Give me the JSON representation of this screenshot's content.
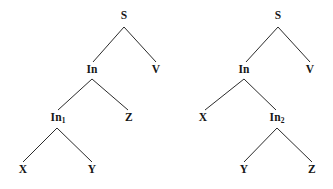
{
  "figure": {
    "background_color": "#ffffff",
    "edge_color": "#2b2b2b",
    "text_color": "#161616",
    "trees": [
      {
        "name": "left-tree",
        "root": "S",
        "nodes": [
          {
            "id": "l-s",
            "label": "S",
            "sub": "",
            "x": 124,
            "y": 16
          },
          {
            "id": "l-in",
            "label": "In",
            "sub": "",
            "x": 92,
            "y": 70
          },
          {
            "id": "l-v",
            "label": "V",
            "sub": "",
            "x": 156,
            "y": 70
          },
          {
            "id": "l-in1",
            "label": "In",
            "sub": "1",
            "x": 58,
            "y": 118
          },
          {
            "id": "l-z",
            "label": "Z",
            "sub": "",
            "x": 129,
            "y": 118
          },
          {
            "id": "l-x",
            "label": "X",
            "sub": "",
            "x": 23,
            "y": 170
          },
          {
            "id": "l-y",
            "label": "Y",
            "sub": "",
            "x": 92,
            "y": 170
          }
        ],
        "edges": [
          {
            "from": "l-s",
            "to": "l-in",
            "x1": 124,
            "y1": 27,
            "x2": 93,
            "y2": 62
          },
          {
            "from": "l-s",
            "to": "l-v",
            "x1": 124,
            "y1": 27,
            "x2": 156,
            "y2": 62
          },
          {
            "from": "l-in",
            "to": "l-in1",
            "x1": 92,
            "y1": 79,
            "x2": 58,
            "y2": 110
          },
          {
            "from": "l-in",
            "to": "l-z",
            "x1": 92,
            "y1": 79,
            "x2": 128,
            "y2": 110
          },
          {
            "from": "l-in1",
            "to": "l-x",
            "x1": 57,
            "y1": 128,
            "x2": 23,
            "y2": 162
          },
          {
            "from": "l-in1",
            "to": "l-y",
            "x1": 57,
            "y1": 128,
            "x2": 92,
            "y2": 162
          }
        ]
      },
      {
        "name": "right-tree",
        "root": "S",
        "nodes": [
          {
            "id": "r-s",
            "label": "S",
            "sub": "",
            "x": 278,
            "y": 16
          },
          {
            "id": "r-in",
            "label": "In",
            "sub": "",
            "x": 244,
            "y": 70
          },
          {
            "id": "r-v",
            "label": "V",
            "sub": "",
            "x": 310,
            "y": 70
          },
          {
            "id": "r-x",
            "label": "X",
            "sub": "",
            "x": 203,
            "y": 118
          },
          {
            "id": "r-in2",
            "label": "In",
            "sub": "2",
            "x": 277,
            "y": 118
          },
          {
            "id": "r-y",
            "label": "Y",
            "sub": "",
            "x": 244,
            "y": 170
          },
          {
            "id": "r-z",
            "label": "Z",
            "sub": "",
            "x": 312,
            "y": 170
          }
        ],
        "edges": [
          {
            "from": "r-s",
            "to": "r-in",
            "x1": 278,
            "y1": 27,
            "x2": 246,
            "y2": 62
          },
          {
            "from": "r-s",
            "to": "r-v",
            "x1": 278,
            "y1": 27,
            "x2": 310,
            "y2": 62
          },
          {
            "from": "r-in",
            "to": "r-x",
            "x1": 244,
            "y1": 79,
            "x2": 205,
            "y2": 110
          },
          {
            "from": "r-in",
            "to": "r-in2",
            "x1": 244,
            "y1": 79,
            "x2": 276,
            "y2": 110
          },
          {
            "from": "r-in2",
            "to": "r-y",
            "x1": 277,
            "y1": 128,
            "x2": 244,
            "y2": 162
          },
          {
            "from": "r-in2",
            "to": "r-z",
            "x1": 277,
            "y1": 128,
            "x2": 312,
            "y2": 162
          }
        ]
      }
    ]
  }
}
